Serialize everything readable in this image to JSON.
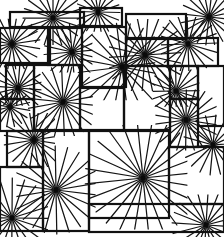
{
  "artwork": {
    "title": "Starburst line pattern",
    "width": 224,
    "height": 237,
    "background": "#ffffff",
    "ink": "#111111",
    "frames": [
      {
        "x": 10,
        "y": 12,
        "w": 74,
        "h": 15
      },
      {
        "x": 80,
        "y": 8,
        "w": 42,
        "h": 18
      },
      {
        "x": 0,
        "y": 28,
        "w": 50,
        "h": 35
      },
      {
        "x": 48,
        "y": 28,
        "w": 34,
        "h": 37
      },
      {
        "x": 82,
        "y": 27,
        "w": 44,
        "h": 60
      },
      {
        "x": 126,
        "y": 14,
        "w": 60,
        "h": 25
      },
      {
        "x": 126,
        "y": 38,
        "w": 42,
        "h": 28
      },
      {
        "x": 168,
        "y": 38,
        "w": 50,
        "h": 28
      },
      {
        "x": 6,
        "y": 65,
        "w": 28,
        "h": 34
      },
      {
        "x": 34,
        "y": 65,
        "w": 46,
        "h": 65
      },
      {
        "x": 0,
        "y": 99,
        "w": 34,
        "h": 32
      },
      {
        "x": 80,
        "y": 88,
        "w": 44,
        "h": 42
      },
      {
        "x": 124,
        "y": 66,
        "w": 46,
        "h": 64
      },
      {
        "x": 170,
        "y": 66,
        "w": 28,
        "h": 33
      },
      {
        "x": 198,
        "y": 66,
        "w": 26,
        "h": 60
      },
      {
        "x": 170,
        "y": 99,
        "w": 28,
        "h": 48
      },
      {
        "x": 7,
        "y": 131,
        "w": 36,
        "h": 36
      },
      {
        "x": 43,
        "y": 131,
        "w": 46,
        "h": 100
      },
      {
        "x": 89,
        "y": 131,
        "w": 80,
        "h": 87
      },
      {
        "x": 169,
        "y": 147,
        "w": 55,
        "h": 57
      },
      {
        "x": 0,
        "y": 167,
        "w": 43,
        "h": 64
      },
      {
        "x": 89,
        "y": 204,
        "w": 135,
        "h": 28
      }
    ],
    "stars": [
      {
        "cx": 53,
        "cy": 18,
        "rays": 20,
        "r": 30
      },
      {
        "cx": 98,
        "cy": 12,
        "rays": 18,
        "r": 22
      },
      {
        "cx": 209,
        "cy": 17,
        "rays": 20,
        "r": 28
      },
      {
        "cx": 12,
        "cy": 44,
        "rays": 20,
        "r": 28
      },
      {
        "cx": 72,
        "cy": 52,
        "rays": 20,
        "r": 28
      },
      {
        "cx": 188,
        "cy": 44,
        "rays": 20,
        "r": 30
      },
      {
        "cx": 145,
        "cy": 55,
        "rays": 22,
        "r": 40
      },
      {
        "cx": 18,
        "cy": 88,
        "rays": 20,
        "r": 26
      },
      {
        "cx": 63,
        "cy": 102,
        "rays": 22,
        "r": 36
      },
      {
        "cx": 122,
        "cy": 67,
        "rays": 20,
        "r": 44
      },
      {
        "cx": 10,
        "cy": 107,
        "rays": 16,
        "r": 20
      },
      {
        "cx": 176,
        "cy": 91,
        "rays": 20,
        "r": 26
      },
      {
        "cx": 186,
        "cy": 120,
        "rays": 22,
        "r": 34
      },
      {
        "cx": 213,
        "cy": 145,
        "rays": 18,
        "r": 30
      },
      {
        "cx": 34,
        "cy": 140,
        "rays": 20,
        "r": 30
      },
      {
        "cx": 56,
        "cy": 190,
        "rays": 22,
        "r": 44
      },
      {
        "cx": 143,
        "cy": 178,
        "rays": 24,
        "r": 58
      },
      {
        "cx": 12,
        "cy": 218,
        "rays": 20,
        "r": 40
      },
      {
        "cx": 206,
        "cy": 225,
        "rays": 20,
        "r": 34
      }
    ]
  }
}
